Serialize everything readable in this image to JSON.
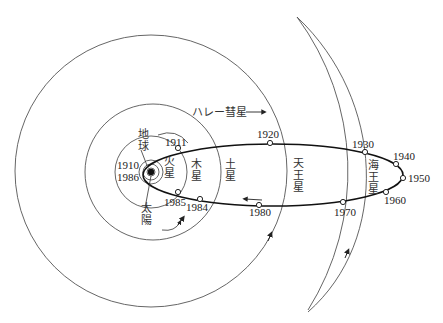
{
  "diagram": {
    "sun": {
      "label_line1": "太",
      "label_line2": "陽",
      "x": 151,
      "y": 172
    },
    "earth": {
      "label_line1": "地",
      "label_line2": "球"
    },
    "comet_label": "ハレー彗星",
    "comet_arrow": "→",
    "planets": [
      {
        "name": "火星",
        "line1": "火",
        "line2": "星"
      },
      {
        "name": "木星",
        "line1": "木",
        "line2": "星"
      },
      {
        "name": "土星",
        "line1": "土",
        "line2": "星"
      },
      {
        "name": "天王星",
        "line1": "天",
        "line2": "王",
        "line3": "星"
      },
      {
        "name": "海王星",
        "line1": "海",
        "line2": "王",
        "line3": "星"
      }
    ],
    "years": {
      "y1910": "1910",
      "y1986": "1986",
      "y1911": "1911",
      "y1920": "1920",
      "y1930": "1930",
      "y1940": "1940",
      "y1950": "1950",
      "y1960": "1960",
      "y1970": "1970",
      "y1980": "1980",
      "y1984": "1984",
      "y1985": "1985"
    }
  }
}
